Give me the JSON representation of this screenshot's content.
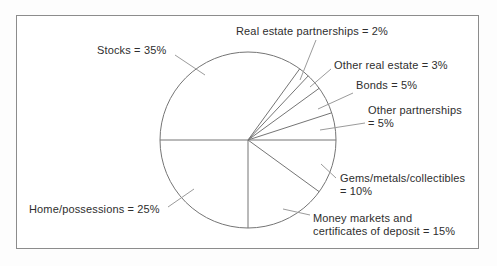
{
  "chart_data": {
    "type": "pie",
    "title": "",
    "unit": "percent",
    "total": 100,
    "start_angle_deg": 54,
    "direction": "clockwise",
    "legend_position": "none",
    "layout": {
      "center_x": 248,
      "center_y": 140,
      "radius": 88,
      "frame": {
        "left": 16,
        "top": 15,
        "width": 463,
        "height": 234
      }
    },
    "colors": {
      "outline": "#757575",
      "leader": "#9b9b9b",
      "text": "#2e2e2e",
      "frame_border": "#8c8c8c",
      "background": "#ffffff"
    },
    "slices": [
      {
        "name": "Real estate partnerships",
        "value": 2,
        "display": "Real estate partnerships = 2%",
        "label_pos": {
          "x": 236,
          "y": 25
        },
        "leader": [
          316,
          40,
          300,
          80
        ]
      },
      {
        "name": "Other real estate",
        "value": 3,
        "display": "Other real estate = 3%",
        "label_pos": {
          "x": 334,
          "y": 59
        },
        "leader": [
          331,
          69,
          310,
          87
        ]
      },
      {
        "name": "Bonds",
        "value": 5,
        "display": "Bonds = 5%",
        "label_pos": {
          "x": 356,
          "y": 79
        },
        "leader": [
          353,
          93,
          318,
          109
        ]
      },
      {
        "name": "Other partnerships",
        "value": 5,
        "display": "Other partnerships\n= 5%",
        "label_pos": {
          "x": 368,
          "y": 104
        },
        "leader": [
          365,
          123,
          320,
          130
        ]
      },
      {
        "name": "Gems/metals/collectibles",
        "value": 10,
        "display": "Gems/metals/collectibles\n= 10%",
        "label_pos": {
          "x": 340,
          "y": 172
        },
        "leader": [
          336,
          178,
          321,
          164
        ]
      },
      {
        "name": "Money markets and certificates of deposit",
        "value": 15,
        "display": "Money markets and\ncertificates of deposit = 15%",
        "label_pos": {
          "x": 313,
          "y": 212
        },
        "leader": [
          310,
          215,
          283,
          209
        ]
      },
      {
        "name": "Home/possessions",
        "value": 25,
        "display": "Home/possessions = 25%",
        "label_pos": {
          "x": 29,
          "y": 203
        },
        "leader": [
          168,
          207,
          194,
          189
        ]
      },
      {
        "name": "Stocks",
        "value": 35,
        "display": "Stocks = 35%",
        "label_pos": {
          "x": 97,
          "y": 44
        },
        "leader": [
          175,
          55,
          205,
          75
        ]
      }
    ]
  }
}
